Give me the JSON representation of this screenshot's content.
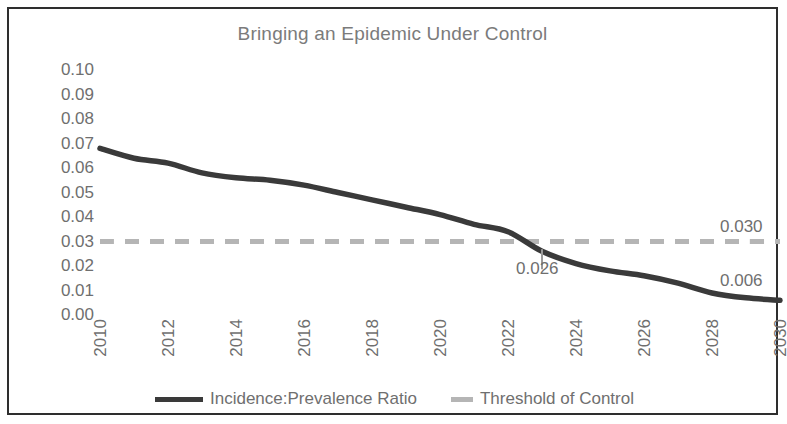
{
  "chart_data": {
    "type": "line",
    "title": "Bringing an Epidemic Under Control",
    "xlabel": "",
    "ylabel": "",
    "xlim": [
      2010,
      2030
    ],
    "ylim": [
      0.0,
      0.1
    ],
    "grid": false,
    "legend_position": "bottom",
    "x": [
      2010,
      2011,
      2012,
      2013,
      2014,
      2015,
      2016,
      2017,
      2018,
      2019,
      2020,
      2021,
      2022,
      2023,
      2024,
      2025,
      2026,
      2027,
      2028,
      2029,
      2030
    ],
    "series": [
      {
        "name": "Incidence:Prevalence Ratio",
        "style": "solid",
        "color": "#3a3a3a",
        "values": [
          0.068,
          0.064,
          0.062,
          0.058,
          0.056,
          0.055,
          0.053,
          0.05,
          0.047,
          0.044,
          0.041,
          0.037,
          0.034,
          0.026,
          0.021,
          0.018,
          0.016,
          0.013,
          0.009,
          0.007,
          0.006
        ]
      },
      {
        "name": "Threshold of Control",
        "style": "dashed",
        "color": "#b5b5b5",
        "constant": 0.03,
        "values": [
          0.03,
          0.03,
          0.03,
          0.03,
          0.03,
          0.03,
          0.03,
          0.03,
          0.03,
          0.03,
          0.03,
          0.03,
          0.03,
          0.03,
          0.03,
          0.03,
          0.03,
          0.03,
          0.03,
          0.03,
          0.03
        ]
      }
    ],
    "y_ticks": [
      "0.10",
      "0.09",
      "0.08",
      "0.07",
      "0.06",
      "0.05",
      "0.04",
      "0.03",
      "0.02",
      "0.01",
      "0.00"
    ],
    "y_tick_values": [
      0.1,
      0.09,
      0.08,
      0.07,
      0.06,
      0.05,
      0.04,
      0.03,
      0.02,
      0.01,
      0.0
    ],
    "x_ticks": [
      "2010",
      "2012",
      "2014",
      "2016",
      "2018",
      "2020",
      "2022",
      "2024",
      "2026",
      "2028",
      "2030"
    ],
    "x_tick_values": [
      2010,
      2012,
      2014,
      2016,
      2018,
      2020,
      2022,
      2024,
      2026,
      2028,
      2030
    ],
    "annotations": [
      {
        "text": "0.030",
        "x": 2029,
        "y": 0.0355,
        "series": "Threshold of Control"
      },
      {
        "text": "0.026",
        "x": 2023,
        "y": 0.0185,
        "series": "Incidence:Prevalence Ratio"
      },
      {
        "text": "0.006",
        "x": 2029,
        "y": 0.0135,
        "series": "Incidence:Prevalence Ratio"
      }
    ]
  },
  "legend": {
    "entries": [
      {
        "label": "Incidence:Prevalence Ratio"
      },
      {
        "label": "Threshold of Control"
      }
    ]
  },
  "colors": {
    "line": "#3a3a3a",
    "threshold": "#b5b5b5",
    "text": "#6f6f6f",
    "border": "#2e2e2e",
    "background": "#ffffff"
  }
}
